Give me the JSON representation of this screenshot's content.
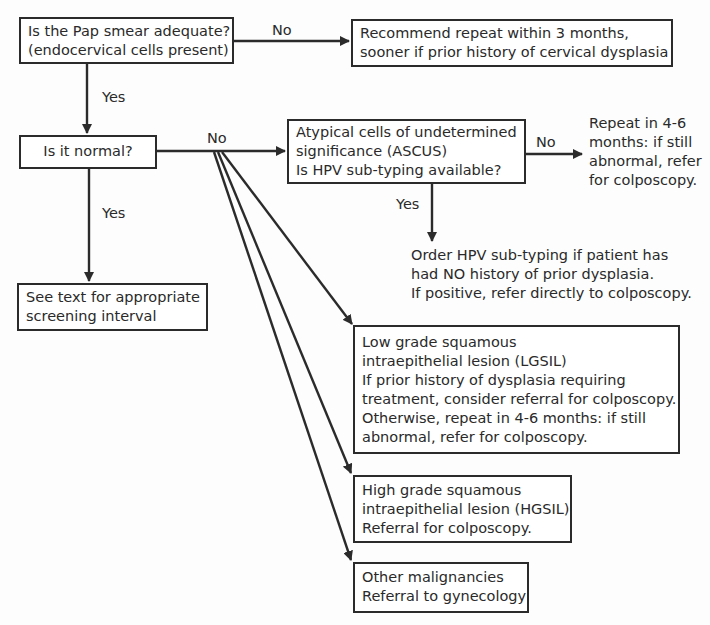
{
  "diagram": {
    "type": "flowchart",
    "nodes": {
      "adequate": {
        "lines": [
          "Is the Pap smear adequate?",
          "(endocervical cells present)"
        ]
      },
      "recommend_repeat": {
        "lines": [
          "Recommend repeat within 3 months,",
          "sooner if prior history of cervical dysplasia"
        ]
      },
      "normal": {
        "lines": [
          "Is it normal?"
        ]
      },
      "ascus": {
        "lines": [
          "Atypical cells of undetermined",
          "significance (ASCUS)",
          "Is HPV sub-typing available?"
        ]
      },
      "ascus_no_action": {
        "lines": [
          "Repeat in 4-6",
          "months: if still",
          "abnormal, refer",
          "for colposcopy."
        ]
      },
      "ascus_yes_action": {
        "lines": [
          "Order HPV sub-typing if patient has",
          "had NO history of prior dysplasia.",
          "If positive, refer directly to colposcopy."
        ]
      },
      "screening_interval": {
        "lines": [
          "See text for appropriate",
          "screening interval"
        ]
      },
      "lgsil": {
        "lines": [
          "Low grade squamous",
          "intraepithelial lesion (LGSIL)",
          "If prior history of dysplasia requiring",
          "treatment, consider referral for colposcopy.",
          "Otherwise, repeat in 4-6 months: if still",
          "abnormal, refer for colposcopy."
        ]
      },
      "hgsil": {
        "lines": [
          "High grade squamous",
          "intraepithelial lesion (HGSIL)",
          "Referral for colposcopy."
        ]
      },
      "other_malignancies": {
        "lines": [
          "Other malignancies",
          "Referral to gynecology"
        ]
      }
    },
    "edge_labels": {
      "adequate_no": "No",
      "adequate_yes": "Yes",
      "normal_no": "No",
      "normal_yes": "Yes",
      "ascus_no": "No",
      "ascus_yes": "Yes"
    },
    "edges": [
      {
        "from": "adequate",
        "to": "recommend_repeat",
        "label": "No"
      },
      {
        "from": "adequate",
        "to": "normal",
        "label": "Yes"
      },
      {
        "from": "normal",
        "to": "ascus",
        "label": "No"
      },
      {
        "from": "normal",
        "to": "lgsil",
        "label": "No"
      },
      {
        "from": "normal",
        "to": "hgsil",
        "label": "No"
      },
      {
        "from": "normal",
        "to": "other_malignancies",
        "label": "No"
      },
      {
        "from": "normal",
        "to": "screening_interval",
        "label": "Yes"
      },
      {
        "from": "ascus",
        "to": "ascus_no_action",
        "label": "No"
      },
      {
        "from": "ascus",
        "to": "ascus_yes_action",
        "label": "Yes"
      }
    ],
    "colors": {
      "stroke": "#2b2b2b",
      "text": "#2a2a2a",
      "background": "#fdfdfd"
    }
  }
}
